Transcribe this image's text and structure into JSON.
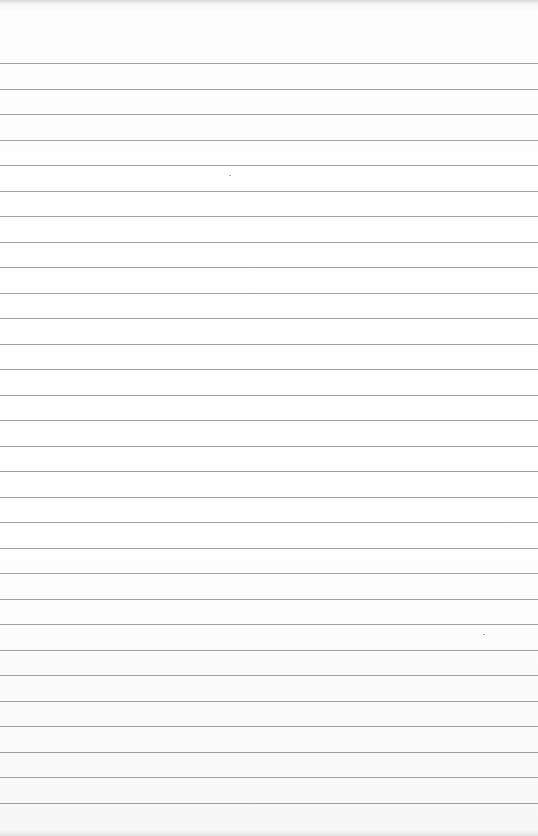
{
  "paper": {
    "type": "lined-paper",
    "background": "#ffffff",
    "rule_color": "#8f8f8f",
    "rule_count": 30,
    "first_rule_y": 63,
    "rule_spacing": 25.5
  },
  "specks": [
    {
      "x": 229,
      "y": 175
    },
    {
      "x": 483,
      "y": 634
    }
  ]
}
